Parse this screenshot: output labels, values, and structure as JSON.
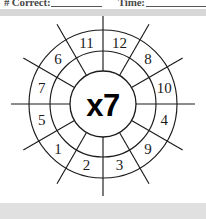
{
  "header": {
    "correct_label": "# Correct:",
    "correct_blank": "",
    "time_label": "Time:",
    "time_blank": ""
  },
  "wheel": {
    "center_label": "x7",
    "multiplier": 7,
    "operator": "x",
    "sector_count": 12,
    "numbers_clockwise_from_top": [
      12,
      8,
      10,
      4,
      9,
      3,
      2,
      1,
      5,
      7,
      6,
      11
    ],
    "sectors": [
      {
        "position": 1,
        "label": "12"
      },
      {
        "position": 2,
        "label": "8"
      },
      {
        "position": 3,
        "label": "10"
      },
      {
        "position": 4,
        "label": "4"
      },
      {
        "position": 5,
        "label": "9"
      },
      {
        "position": 6,
        "label": "3"
      },
      {
        "position": 7,
        "label": "2"
      },
      {
        "position": 8,
        "label": "1"
      },
      {
        "position": 9,
        "label": "5"
      },
      {
        "position": 10,
        "label": "7"
      },
      {
        "position": 11,
        "label": "6"
      },
      {
        "position": 12,
        "label": "11"
      }
    ]
  },
  "colors": {
    "ink": "#1b1b1b",
    "page": "#ffffff",
    "header_band": "#d7d7d7",
    "footer_band": "#e0e0e0",
    "rule": "#55565a"
  }
}
